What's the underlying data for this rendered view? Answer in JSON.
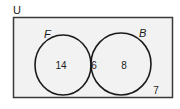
{
  "universe": {
    "label": "U",
    "fill": "#f2f2f2",
    "stroke": "#2a2a2a"
  },
  "sets": [
    {
      "label": "F",
      "only_value": "14"
    },
    {
      "label": "B",
      "only_value": "8"
    }
  ],
  "intersection_value": "6",
  "outside_value": "7"
}
